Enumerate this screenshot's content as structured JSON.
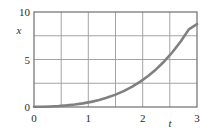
{
  "chart_data": {
    "type": "line",
    "title": "",
    "xlabel": "t",
    "ylabel": "x",
    "xlim": [
      0,
      3
    ],
    "ylim": [
      0,
      10
    ],
    "grid": true,
    "legend": null,
    "x_ticks": [
      0,
      1,
      2,
      3
    ],
    "x_tick_labels": [
      "0",
      "1",
      "2",
      "3"
    ],
    "y_ticks": [
      0,
      5,
      10
    ],
    "y_tick_labels": [
      "0",
      "5",
      "10"
    ],
    "x_gridlines": [
      0,
      0.5,
      1,
      1.5,
      2,
      2.5,
      3
    ],
    "y_gridlines": [
      0,
      2.5,
      5,
      7.5,
      10
    ],
    "series": [
      {
        "name": "x(t)",
        "color": "#808080",
        "line_width": 2.6,
        "x": [
          0,
          0.15,
          0.3,
          0.45,
          0.6,
          0.75,
          0.9,
          1.05,
          1.2,
          1.35,
          1.5,
          1.65,
          1.8,
          1.95,
          2.1,
          2.25,
          2.4,
          2.55,
          2.7,
          2.85,
          3
        ],
        "values": [
          0.02,
          0.03,
          0.06,
          0.1,
          0.17,
          0.26,
          0.38,
          0.54,
          0.74,
          0.99,
          1.3,
          1.67,
          2.11,
          2.64,
          3.26,
          3.98,
          4.82,
          5.79,
          6.9,
          8.17,
          8.72
        ]
      }
    ]
  },
  "labels": {
    "y_axis_title": "x",
    "x_axis_title": "t",
    "y_tick_10": "10",
    "y_tick_5": "5",
    "y_tick_0": "0",
    "x_tick_0": "0",
    "x_tick_1": "1",
    "x_tick_2": "2",
    "x_tick_3": "3"
  },
  "colors": {
    "curve": "#808080",
    "grid": "#9a9a9a",
    "frame": "#6e6e6e",
    "text": "#2b2b2b",
    "background": "#ffffff"
  }
}
